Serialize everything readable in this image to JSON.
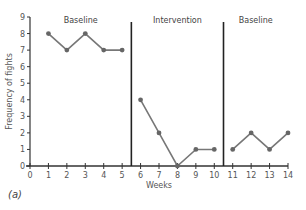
{
  "chart_data": {
    "type": "line",
    "title": "",
    "xlabel": "Weeks",
    "ylabel": "Frequency of fights",
    "xlim": [
      0,
      14
    ],
    "ylim": [
      0,
      9
    ],
    "x_ticks": [
      0,
      1,
      2,
      3,
      4,
      5,
      6,
      7,
      8,
      9,
      10,
      11,
      12,
      13,
      14
    ],
    "y_ticks": [
      0,
      1,
      2,
      3,
      4,
      5,
      6,
      7,
      8,
      9
    ],
    "grid": false,
    "legend": null,
    "panel_label": "(a)",
    "phases": [
      {
        "label": "Baseline",
        "x_start": 0,
        "x_end": 5.5
      },
      {
        "label": "Intervention",
        "x_start": 5.5,
        "x_end": 10.5
      },
      {
        "label": "Baseline",
        "x_start": 10.5,
        "x_end": 14
      }
    ],
    "phase_dividers": [
      5.5,
      10.5
    ],
    "series": [
      {
        "name": "Baseline",
        "x": [
          1,
          2,
          3,
          4,
          5
        ],
        "values": [
          8,
          7,
          8,
          7,
          7
        ]
      },
      {
        "name": "Intervention",
        "x": [
          6,
          7,
          8,
          9,
          10
        ],
        "values": [
          4,
          2,
          0,
          1,
          1
        ]
      },
      {
        "name": "Baseline (return)",
        "x": [
          11,
          12,
          13,
          14
        ],
        "values": [
          1,
          2,
          1,
          2
        ]
      }
    ],
    "colors": {
      "line": "#777777",
      "marker": "#666666",
      "axis": "#333333",
      "divider": "#222222"
    }
  }
}
